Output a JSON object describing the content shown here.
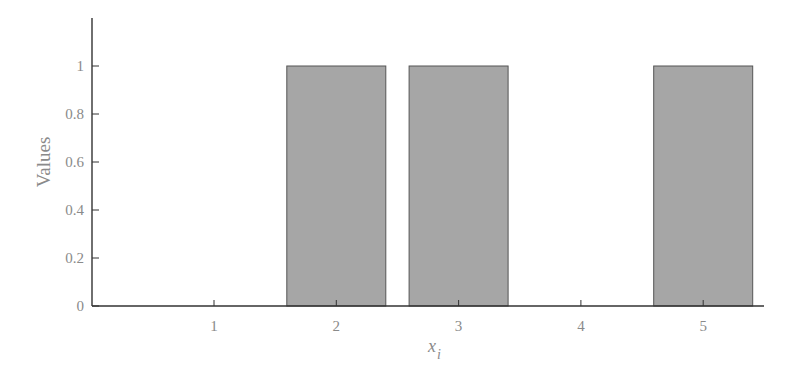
{
  "chart_data": {
    "type": "bar",
    "title": "",
    "categories": [
      "1",
      "2",
      "3",
      "4",
      "5"
    ],
    "values": [
      0,
      1,
      1,
      0,
      1
    ],
    "xlabel": "x_i",
    "xlabel_main": "x",
    "xlabel_sub": "i",
    "ylabel": "Values",
    "ylim": [
      0,
      1.18
    ],
    "yticks": [
      "0",
      "0.2",
      "0.4",
      "0.6",
      "0.8",
      "1"
    ],
    "xticks": [
      "1",
      "2",
      "3",
      "4",
      "5"
    ],
    "grid": false,
    "legend": null,
    "bar_color": "#a6a6a6",
    "bar_edge_color": "#555555",
    "axis_color": "#333333",
    "text_color": "#8a8a8a"
  }
}
